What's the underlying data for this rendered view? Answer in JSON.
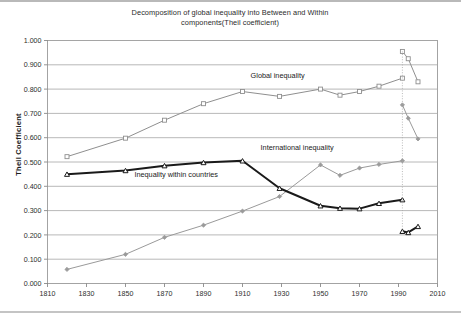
{
  "chart_data": {
    "type": "line",
    "title": "Decomposition of global inequality into Between and Within components(Theil coefficient)",
    "title_line1": "Decomposition of global inequality into Between and Within",
    "title_line2": "components(Theil coefficient)",
    "xlabel": "",
    "ylabel": "Theil Coefficient",
    "xlim": [
      1810,
      2010
    ],
    "ylim": [
      0.0,
      1.0
    ],
    "grid": "horizontal",
    "legend_position": "inline-annotations",
    "xticks": [
      1810,
      1830,
      1850,
      1870,
      1890,
      1910,
      1930,
      1950,
      1970,
      1990,
      2010
    ],
    "xtick_labels": [
      "1810",
      "1830",
      "1850",
      "1870",
      "1890",
      "1910",
      "1930",
      "1950",
      "1970",
      "1990",
      "2010"
    ],
    "yticks": [
      0.0,
      0.1,
      0.2,
      0.3,
      0.4,
      0.5,
      0.6,
      0.7,
      0.8,
      0.9,
      1.0
    ],
    "ytick_labels": [
      "0.000",
      "0.100",
      "0.200",
      "0.300",
      "0.400",
      "0.500",
      "0.600",
      "0.700",
      "0.800",
      "0.900",
      "1.000"
    ],
    "break_year": 1992,
    "break_line_style": "dotted-vertical",
    "series": [
      {
        "name": "Global inequality",
        "marker": "open-square",
        "color": "#8f8f8f",
        "line_width": 1.0,
        "x": [
          1820,
          1850,
          1870,
          1890,
          1910,
          1929,
          1950,
          1960,
          1970,
          1980,
          1992
        ],
        "values": [
          0.522,
          0.598,
          0.672,
          0.74,
          0.79,
          0.77,
          0.8,
          0.775,
          0.79,
          0.812,
          0.845
        ],
        "branch_x": [
          1992,
          1995,
          2000
        ],
        "branch_values": [
          0.955,
          0.925,
          0.83
        ]
      },
      {
        "name": "International inequality",
        "marker": "filled-diamond",
        "color": "#9a9a9a",
        "line_width": 1.0,
        "x": [
          1820,
          1850,
          1870,
          1890,
          1910,
          1929,
          1950,
          1960,
          1970,
          1980,
          1992
        ],
        "values": [
          0.058,
          0.12,
          0.19,
          0.24,
          0.298,
          0.358,
          0.488,
          0.445,
          0.475,
          0.49,
          0.505
        ],
        "branch_x": [
          1992,
          1995,
          2000
        ],
        "branch_values": [
          0.735,
          0.68,
          0.595
        ]
      },
      {
        "name": "Inequality within countries",
        "marker": "open-triangle",
        "color": "#1a1a1a",
        "line_width": 2.0,
        "x": [
          1820,
          1850,
          1870,
          1890,
          1910,
          1929,
          1950,
          1960,
          1970,
          1980,
          1992
        ],
        "values": [
          0.45,
          0.465,
          0.485,
          0.498,
          0.505,
          0.392,
          0.32,
          0.31,
          0.308,
          0.33,
          0.345
        ],
        "branch_x": [
          1992,
          1995,
          2000
        ],
        "branch_values": [
          0.215,
          0.21,
          0.235
        ]
      }
    ],
    "annotations": [
      {
        "text": "Global inequality",
        "x": 1928,
        "y": 0.845
      },
      {
        "text": "International inequality",
        "x": 1938,
        "y": 0.548
      },
      {
        "text": "Inequality within countries",
        "x": 1876,
        "y": 0.437
      }
    ]
  }
}
